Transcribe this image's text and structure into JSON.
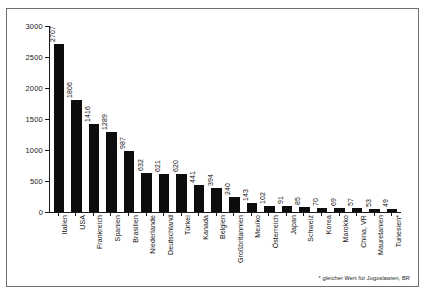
{
  "chart_data": {
    "type": "bar",
    "title": "",
    "xlabel": "",
    "ylabel": "",
    "ylim": [
      0,
      3000
    ],
    "ytick_step": 500,
    "yticks": [
      "0",
      "500",
      "1000",
      "1500",
      "2000",
      "2500",
      "3000"
    ],
    "grid": false,
    "legend": "none",
    "orientation": "vertical",
    "bar_color": "#0d0d0d",
    "value_labels": true,
    "categories": [
      "Italien",
      "USA",
      "Frankreich",
      "Spanien",
      "Brasilien",
      "Niederlande",
      "Deutschland",
      "Türkei",
      "Kanada",
      "Belgien",
      "Großbritannien",
      "Mexiko",
      "Österreich",
      "Japan",
      "Schweiz",
      "Korea",
      "Marokko",
      "China, VR",
      "Mauretanien",
      "Tunesien*"
    ],
    "values": [
      2707,
      1806,
      1416,
      1289,
      987,
      632,
      621,
      620,
      441,
      394,
      240,
      143,
      102,
      91,
      85,
      70,
      69,
      57,
      53,
      49
    ],
    "annotations": [
      "* gleicher Wert für Jugoslawien, BR"
    ]
  },
  "footnote": "* gleicher Wert für Jugoslawien, BR"
}
